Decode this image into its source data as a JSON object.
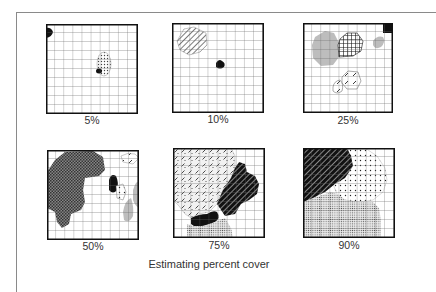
{
  "figure": {
    "caption": "Estimating percent cover",
    "grid": {
      "rows": 10,
      "cols": 10
    },
    "panels": [
      {
        "label": "5%",
        "cover_percent": 5
      },
      {
        "label": "10%",
        "cover_percent": 10
      },
      {
        "label": "25%",
        "cover_percent": 25
      },
      {
        "label": "50%",
        "cover_percent": 50
      },
      {
        "label": "75%",
        "cover_percent": 75
      },
      {
        "label": "90%",
        "cover_percent": 90
      }
    ]
  },
  "colors": {
    "grid_line": "#555555",
    "border": "#111111",
    "solid_fill": "#111111",
    "gray_fill": "#bdbdbd",
    "dark_gray_fill": "#6e6e6e",
    "frame": "#8a8a8a"
  }
}
